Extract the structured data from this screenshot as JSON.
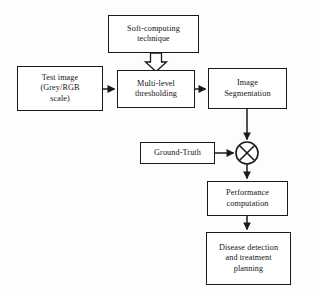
{
  "diagram": {
    "background_color": "#fdfdfd",
    "line_color": "#1a1a1a",
    "text_color": "#141414",
    "nodes": [
      {
        "id": "soft-computing-technique",
        "label": "Soft-computing\ntechnique",
        "lines": [
          "Soft-computing",
          "technique"
        ],
        "x": 108,
        "y": 15,
        "w": 91,
        "h": 38
      },
      {
        "id": "test-image",
        "label": "Test image\n(Grey/RGB\nscale)",
        "lines": [
          "Test image",
          "(Grey/RGB",
          "scale)"
        ],
        "x": 17,
        "y": 66,
        "w": 86,
        "h": 45
      },
      {
        "id": "multi-level-thresholding",
        "label": "Multi-level\nthresholding",
        "lines": [
          "Multi-level",
          "thresholding"
        ],
        "x": 117,
        "y": 70,
        "w": 78,
        "h": 38
      },
      {
        "id": "image-segmentation",
        "label": "Image\nSegmentation",
        "lines": [
          "Image",
          "Segmentation"
        ],
        "x": 208,
        "y": 68,
        "w": 79,
        "h": 41
      },
      {
        "id": "ground-truth",
        "label": "Ground-Truth",
        "lines": [
          "Ground-Truth"
        ],
        "x": 140,
        "y": 142,
        "w": 75,
        "h": 22
      },
      {
        "id": "performance-computation",
        "label": "Performance\ncomputation",
        "lines": [
          "Performance",
          "computation"
        ],
        "x": 207,
        "y": 181,
        "w": 81,
        "h": 35
      },
      {
        "id": "disease-detection",
        "label": "Disease detection\nand treatment\nplanning",
        "lines": [
          "Disease detection",
          "and treatment",
          "planning"
        ],
        "x": 206,
        "y": 232,
        "w": 85,
        "h": 53
      }
    ],
    "junction": {
      "id": "comparison-operator",
      "symbol": "circled-x",
      "cx": 247,
      "cy": 153,
      "r": 11
    },
    "edges": [
      {
        "id": "soft-computing-to-thresholding",
        "type": "hollow-block-arrow",
        "from": "soft-computing-technique",
        "to": "multi-level-thresholding",
        "direction": "down"
      },
      {
        "id": "test-image-to-thresholding",
        "type": "solid-arrow",
        "from": "test-image",
        "to": "multi-level-thresholding",
        "direction": "right"
      },
      {
        "id": "thresholding-to-segmentation",
        "type": "solid-arrow",
        "from": "multi-level-thresholding",
        "to": "image-segmentation",
        "direction": "right"
      },
      {
        "id": "segmentation-to-operator",
        "type": "solid-arrow",
        "from": "image-segmentation",
        "to": "comparison-operator",
        "direction": "down"
      },
      {
        "id": "ground-truth-to-operator",
        "type": "solid-arrow",
        "from": "ground-truth",
        "to": "comparison-operator",
        "direction": "right"
      },
      {
        "id": "operator-to-performance",
        "type": "solid-arrow",
        "from": "comparison-operator",
        "to": "performance-computation",
        "direction": "down"
      },
      {
        "id": "performance-to-disease",
        "type": "solid-arrow",
        "from": "performance-computation",
        "to": "disease-detection",
        "direction": "down"
      }
    ]
  }
}
